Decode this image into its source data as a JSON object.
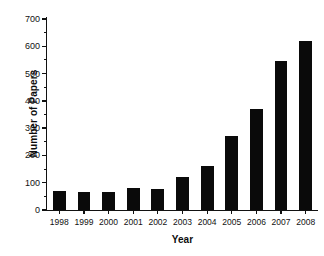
{
  "chart_data": {
    "type": "bar",
    "title": "",
    "xlabel": "Year",
    "ylabel": "Number of Papers",
    "categories": [
      "1998",
      "1999",
      "2000",
      "2001",
      "2002",
      "2003",
      "2004",
      "2005",
      "2006",
      "2007",
      "2008"
    ],
    "values": [
      70,
      65,
      67,
      82,
      78,
      120,
      160,
      270,
      372,
      545,
      618
    ],
    "ylim": [
      0,
      700
    ],
    "ytick_labels": [
      "0",
      "100",
      "200",
      "300",
      "400",
      "500",
      "600",
      "700"
    ],
    "ytick_values": [
      0,
      100,
      200,
      300,
      400,
      500,
      600,
      700
    ],
    "yminor_values": [
      50,
      150,
      250,
      350,
      450,
      550,
      650
    ],
    "grid": false,
    "legend": false,
    "bar_color": "#0a0a0a",
    "axis_color": "#111111"
  }
}
